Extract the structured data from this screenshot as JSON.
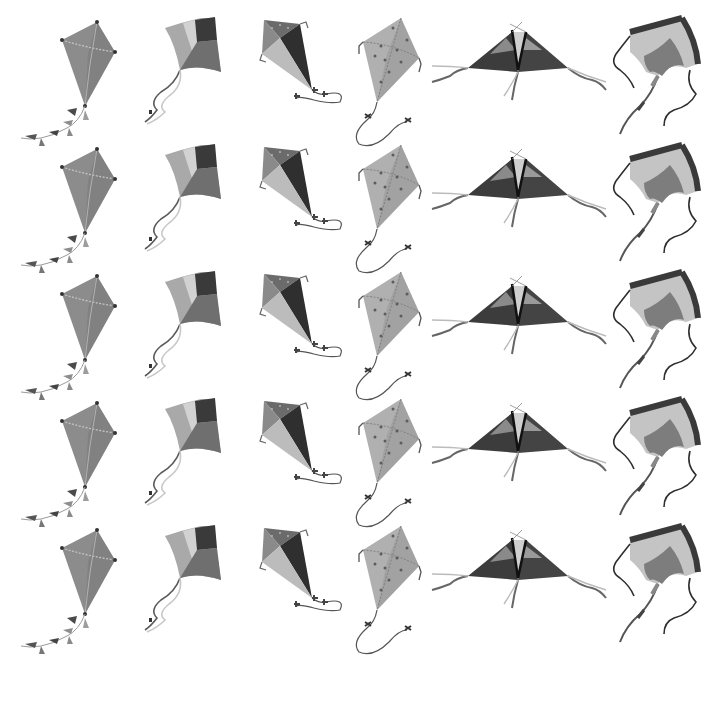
{
  "image": {
    "description": "Grayscale pattern of hand-painted kites arranged in a 5-row by 6-column repeating grid on a white background",
    "background": "#ffffff",
    "rows": 5,
    "columns": 6,
    "row_pitch_px": 127
  },
  "kite_types": [
    {
      "id": "diamond-ribbon",
      "name": "Diamond kite with tassel tail",
      "body": "#8c8c8c",
      "spar": "#bdbdbd",
      "tail": "#6a6a6a"
    },
    {
      "id": "patchwork-curved",
      "name": "Patchwork kite with wavy ribbons",
      "segments": [
        "#a9a9a9",
        "#d2d2d2",
        "#3a3a3a",
        "#6f6f6f"
      ],
      "ribbon": "#5a5a5a"
    },
    {
      "id": "four-panel-bow",
      "name": "Four-panel diamond kite with bow-tie string",
      "segments": [
        "#6b6b6b",
        "#2f2f2f",
        "#bcbcbc",
        "#9a9a9a"
      ],
      "string": "#555555"
    },
    {
      "id": "dotted-diamond",
      "name": "Polka-dot diamond kite with string",
      "body": "#b0b0b0",
      "dots": "#5c5c5c",
      "string": "#555555"
    },
    {
      "id": "delta",
      "name": "Delta kite with streamers",
      "wing_dark": "#3c3c3c",
      "wing_mid": "#7a7a7a",
      "spars": "#111111"
    },
    {
      "id": "stingray",
      "name": "Stingray kite with long tails",
      "border": "#3a3a3a",
      "body": "#c4c4c4",
      "inner": "#7d7d7d"
    }
  ],
  "columns_x": [
    15,
    135,
    250,
    345,
    430,
    600
  ],
  "rows_y": [
    10,
    137,
    264,
    391,
    518
  ]
}
